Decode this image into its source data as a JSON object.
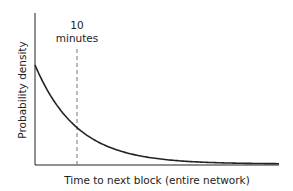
{
  "chart_data": {
    "type": "line",
    "title": "",
    "xlabel": "Time to next block (entire network)",
    "ylabel": "Probability density",
    "annotations": [
      {
        "text_line1": "10",
        "text_line2": "minutes",
        "type": "vertical-dashed-line",
        "x_minutes": 10
      }
    ],
    "series": [
      {
        "name": "exponential density",
        "x_minutes": [
          0,
          5,
          10,
          15,
          20,
          25,
          30,
          40,
          50,
          58
        ],
        "values_relative": [
          1.0,
          0.61,
          0.37,
          0.22,
          0.14,
          0.08,
          0.05,
          0.018,
          0.007,
          0.003
        ]
      }
    ],
    "grid": false,
    "legend": "none",
    "xlim": [
      0,
      58
    ],
    "ylim": [
      0,
      1.5
    ]
  }
}
